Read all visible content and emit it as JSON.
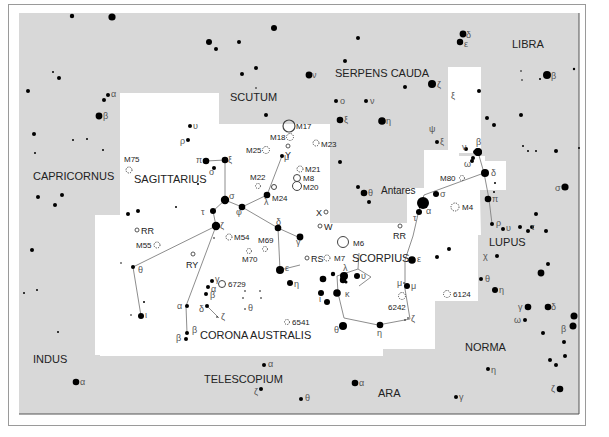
{
  "map": {
    "title": "Star chart: Sagittarius, Scorpius and Corona Australis region",
    "colors": {
      "outside_region": "#d8d8d8",
      "highlight_region": "#ffffff",
      "star": "#000000",
      "line": "#777777",
      "text": "#222222",
      "greek": "#555555"
    },
    "constellation_labels": [
      {
        "id": "libra",
        "text": "LIBRA",
        "x": 512,
        "y": 48
      },
      {
        "id": "serpens-cauda",
        "text": "SERPENS CAUDA",
        "x": 335,
        "y": 77
      },
      {
        "id": "scutum",
        "text": "SCUTUM",
        "x": 230,
        "y": 101
      },
      {
        "id": "capricornus",
        "text": "CAPRICORNUS",
        "x": 33,
        "y": 180
      },
      {
        "id": "sagittarius",
        "text": "SAGITTARIUS",
        "x": 134,
        "y": 183
      },
      {
        "id": "scorpius",
        "text": "SCORPIUS",
        "x": 352,
        "y": 262
      },
      {
        "id": "lupus",
        "text": "LUPUS",
        "x": 489,
        "y": 246
      },
      {
        "id": "corona-australis",
        "text": "CORONA AUSTRALIS",
        "x": 200,
        "y": 339
      },
      {
        "id": "norma",
        "text": "NORMA",
        "x": 465,
        "y": 351
      },
      {
        "id": "indus",
        "text": "INDUS",
        "x": 33,
        "y": 363
      },
      {
        "id": "telescopium",
        "text": "TELESCOPIUM",
        "x": 204,
        "y": 383
      },
      {
        "id": "ara",
        "text": "ARA",
        "x": 378,
        "y": 397
      }
    ],
    "star_labels": [
      {
        "text": "Antares",
        "x": 381,
        "y": 194
      }
    ],
    "deep_sky_objects": [
      {
        "id": "M17",
        "text": "M17",
        "type": "nebula",
        "x": 289,
        "y": 126
      },
      {
        "id": "M18",
        "text": "M18",
        "type": "open-cluster",
        "x": 289,
        "y": 137
      },
      {
        "id": "M25",
        "text": "M25",
        "type": "open-cluster",
        "x": 267,
        "y": 150
      },
      {
        "id": "M23",
        "text": "M23",
        "type": "open-cluster",
        "x": 317,
        "y": 144
      },
      {
        "id": "M21",
        "text": "M21",
        "type": "open-cluster",
        "x": 299,
        "y": 169
      },
      {
        "id": "M8",
        "text": "M8",
        "type": "nebula",
        "x": 299,
        "y": 178
      },
      {
        "id": "M20",
        "text": "M20",
        "type": "nebula",
        "x": 298,
        "y": 187
      },
      {
        "id": "M22",
        "text": "M22",
        "type": "globular-cluster",
        "x": 258,
        "y": 186
      },
      {
        "id": "M24",
        "text": "M24",
        "type": "open-cluster",
        "x": 275,
        "y": 189
      },
      {
        "id": "M75",
        "text": "M75",
        "type": "globular-cluster",
        "x": 129,
        "y": 170
      },
      {
        "id": "M54",
        "text": "M54",
        "type": "globular-cluster",
        "x": 229,
        "y": 237
      },
      {
        "id": "M55",
        "text": "M55",
        "type": "globular-cluster",
        "x": 157,
        "y": 246
      },
      {
        "id": "M69",
        "text": "M69",
        "type": "globular-cluster",
        "x": 264,
        "y": 245
      },
      {
        "id": "M70",
        "text": "M70",
        "type": "globular-cluster",
        "x": 248,
        "y": 249
      },
      {
        "id": "M6",
        "text": "M6",
        "type": "open-cluster-large",
        "x": 345,
        "y": 243
      },
      {
        "id": "M7",
        "text": "M7",
        "type": "open-cluster",
        "x": 327,
        "y": 257
      },
      {
        "id": "M80",
        "text": "M80",
        "type": "globular-cluster",
        "x": 460,
        "y": 178
      },
      {
        "id": "M4",
        "text": "M4",
        "type": "globular-cluster",
        "x": 456,
        "y": 207
      },
      {
        "id": "NGC6729",
        "text": "6729",
        "type": "nebula-small",
        "x": 223,
        "y": 284
      },
      {
        "id": "NGC6541",
        "text": "6541",
        "type": "globular-cluster",
        "x": 287,
        "y": 322
      },
      {
        "id": "NGC6242",
        "text": "6242",
        "type": "open-cluster",
        "x": 402,
        "y": 296
      },
      {
        "id": "NGC6124",
        "text": "6124",
        "type": "open-cluster",
        "x": 447,
        "y": 294
      }
    ],
    "variable_stars": [
      {
        "text": "RR",
        "x": 137,
        "y": 230,
        "label_x": 143,
        "label_y": 234
      },
      {
        "text": "RY",
        "x": 193,
        "y": 254,
        "label_x": 186,
        "label_y": 268
      },
      {
        "text": "RS",
        "x": 307,
        "y": 258,
        "label_x": 313,
        "label_y": 262
      },
      {
        "text": "W",
        "x": 320,
        "y": 226,
        "label_x": 325,
        "label_y": 229
      },
      {
        "text": "X",
        "x": 326,
        "y": 212,
        "label_x": 316,
        "label_y": 216
      },
      {
        "text": "Y",
        "x": 288,
        "y": 146,
        "label_x": 285,
        "label_y": 157
      },
      {
        "text": "RR",
        "x": 400,
        "y": 226,
        "label_x": 394,
        "label_y": 239
      }
    ]
  }
}
